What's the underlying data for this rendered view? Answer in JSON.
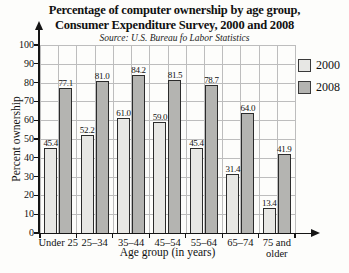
{
  "title": {
    "line1": "Percentage of computer ownership by age group,",
    "line2": "Consumer Expenditure Survey, 2000 and 2008",
    "source": "Source: U.S. Bureau fo Labor Statistics"
  },
  "chart_data": {
    "type": "bar",
    "title": "Percentage of computer ownership by age group, Consumer Expenditure Survey, 2000 and 2008",
    "subtitle": "Source: U.S. Bureau fo Labor Statistics",
    "categories": [
      "Under 25",
      "25–34",
      "35–44",
      "45–54",
      "55–64",
      "65–74",
      "75 and older"
    ],
    "series": [
      {
        "name": "2000",
        "color": "#e7e7e4",
        "values": [
          45.4,
          52.2,
          61.0,
          59.0,
          45.4,
          31.4,
          13.4
        ]
      },
      {
        "name": "2008",
        "color": "#b4b4b1",
        "values": [
          77.1,
          81.0,
          84.2,
          81.5,
          78.7,
          64.0,
          41.9
        ]
      }
    ],
    "xlabel": "Age group (in years)",
    "ylabel": "Percent ownership",
    "ylim": [
      0,
      100
    ],
    "yticks": [
      0,
      10,
      20,
      30,
      40,
      50,
      60,
      70,
      80,
      90,
      100
    ],
    "grid": true,
    "legend_position": "top-right",
    "value_labels": true
  },
  "colors": {
    "bar_2000": "#e7e7e4",
    "bar_2008": "#b4b4b1",
    "grid_line": "#bdbdbd",
    "axis_line": "#151515",
    "text": "#111111"
  }
}
